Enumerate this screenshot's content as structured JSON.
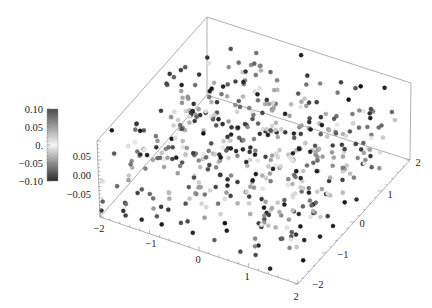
{
  "chart_data": {
    "type": "scatter",
    "subtype": "scatter3d",
    "title": "",
    "xlabel": "",
    "ylabel": "",
    "zlabel": "",
    "x_range": [
      -2,
      2
    ],
    "y_range": [
      -2,
      2
    ],
    "z_range": [
      -0.1,
      0.1
    ],
    "x_ticks": [
      "-2",
      "-1",
      "0",
      "1",
      "2"
    ],
    "y_ticks": [
      "-2",
      "-1",
      "0",
      "1",
      "2"
    ],
    "z_ticks": [
      "0.05",
      "0.00",
      "-0.05"
    ],
    "grid": false,
    "n_points_approx": 500,
    "point_distribution": "uniform random over x,y in [-2,2], z in [-0.1,0.1]",
    "color_mapping": "gray scale by |z|: light near 0, dark near ±0.10",
    "legend": {
      "type": "colorbar",
      "position": "left",
      "ticks": [
        "0.10",
        "0.05",
        "0.",
        "-0.05",
        "-0.10"
      ],
      "min": -0.1,
      "max": 0.1
    },
    "seed": 12345
  },
  "colorbar": {
    "ticks": [
      {
        "label": "0.10"
      },
      {
        "label": "0.05"
      },
      {
        "label": "0."
      },
      {
        "label": "−0.05"
      },
      {
        "label": "−0.10"
      }
    ]
  },
  "axes": {
    "z_labels": [
      "0.05",
      "0.00",
      "−0.05"
    ],
    "front_left_labels": [
      "−2",
      "−1",
      "0",
      "1",
      "2"
    ],
    "front_right_labels": [
      "−2",
      "−1",
      "0",
      "1",
      "2"
    ]
  }
}
